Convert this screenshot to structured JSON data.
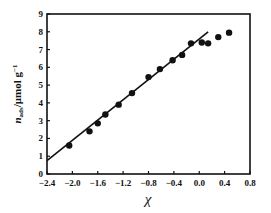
{
  "chart_data": {
    "type": "scatter",
    "title": "",
    "xlabel": "χ",
    "ylabel": "n_ads /μmol g⁻¹",
    "ylabel_main": "n",
    "ylabel_sub": "ads",
    "ylabel_unit": "/μmol g",
    "ylabel_sup": "−1",
    "xlim": [
      -2.4,
      0.8
    ],
    "ylim": [
      0,
      9
    ],
    "xticks": [
      -2.4,
      -2.0,
      -1.6,
      -1.2,
      -0.8,
      -0.4,
      0.0,
      0.4,
      0.8
    ],
    "xtick_labels": [
      "−2.4",
      "−2.0",
      "−1.6",
      "−1.2",
      "−0.8",
      "−0.4",
      "0.0",
      "0.4",
      "0.8"
    ],
    "yticks": [
      0,
      1,
      2,
      3,
      4,
      5,
      6,
      7,
      8,
      9
    ],
    "ytick_labels": [
      "0",
      "1",
      "2",
      "3",
      "4",
      "5",
      "6",
      "7",
      "8",
      "9"
    ],
    "grid": false,
    "legend": null,
    "series": [
      {
        "name": "data",
        "type": "scatter",
        "x": [
          -2.05,
          -1.73,
          -1.6,
          -1.48,
          -1.27,
          -1.06,
          -0.8,
          -0.62,
          -0.42,
          -0.27,
          -0.13,
          0.04,
          0.14,
          0.3,
          0.47
        ],
        "y": [
          1.6,
          2.4,
          2.85,
          3.35,
          3.9,
          4.55,
          5.45,
          5.9,
          6.4,
          6.7,
          7.35,
          7.4,
          7.35,
          7.7,
          7.95
        ]
      },
      {
        "name": "linear fit",
        "type": "line",
        "x": [
          -2.4,
          0.14
        ],
        "y": [
          0.75,
          8.0
        ]
      }
    ]
  }
}
